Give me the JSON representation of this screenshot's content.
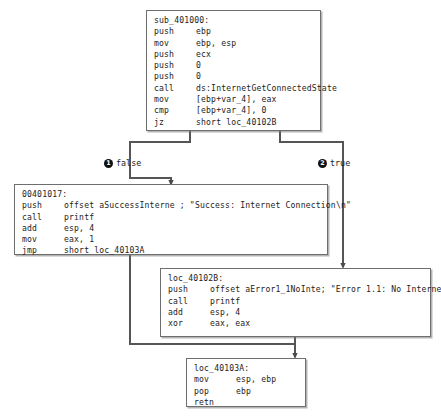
{
  "diagram": {
    "type": "control-flow-graph",
    "line_color": "#555555",
    "box_border_color": "#6e6e6e",
    "marker_color": "#111111",
    "background": "#ffffff"
  },
  "nodes": [
    {
      "id": "entry",
      "label": "sub_401000:",
      "lines": [
        {
          "mnemonic": "push",
          "operands": "ebp"
        },
        {
          "mnemonic": "mov",
          "operands": "ebp, esp"
        },
        {
          "mnemonic": "push",
          "operands": "ecx"
        },
        {
          "mnemonic": "push",
          "operands": "0"
        },
        {
          "mnemonic": "push",
          "operands": "0"
        },
        {
          "mnemonic": "call",
          "operands": "ds:InternetGetConnectedState"
        },
        {
          "mnemonic": "mov",
          "operands": "[ebp+var_4], eax"
        },
        {
          "mnemonic": "cmp",
          "operands": "[ebp+var_4], 0"
        },
        {
          "mnemonic": "jz",
          "operands": "short loc_40102B"
        }
      ]
    },
    {
      "id": "success",
      "label": "00401017:",
      "lines": [
        {
          "mnemonic": "push",
          "operands": "offset aSuccessInterne ; \"Success: Internet Connection\\n\""
        },
        {
          "mnemonic": "call",
          "operands": "printf"
        },
        {
          "mnemonic": "add",
          "operands": "esp, 4"
        },
        {
          "mnemonic": "mov",
          "operands": "eax, 1"
        },
        {
          "mnemonic": "jmp",
          "operands": "short loc_40103A"
        }
      ]
    },
    {
      "id": "error",
      "label": "loc_40102B:",
      "lines": [
        {
          "mnemonic": "push",
          "operands": "offset aError1_1NoInte; \"Error 1.1: No Internet\\n\""
        },
        {
          "mnemonic": "call",
          "operands": "printf"
        },
        {
          "mnemonic": "add",
          "operands": "esp, 4"
        },
        {
          "mnemonic": "xor",
          "operands": "eax, eax"
        }
      ]
    },
    {
      "id": "exit",
      "label": "loc_40103A:",
      "lines": [
        {
          "mnemonic": "mov",
          "operands": "esp, ebp"
        },
        {
          "mnemonic": "pop",
          "operands": "ebp"
        },
        {
          "mnemonic": "retn",
          "operands": ""
        }
      ]
    }
  ],
  "branches": [
    {
      "id": "false",
      "marker": "1",
      "label": "false"
    },
    {
      "id": "true",
      "marker": "2",
      "label": "true"
    }
  ],
  "caption": {
    "text": ""
  }
}
